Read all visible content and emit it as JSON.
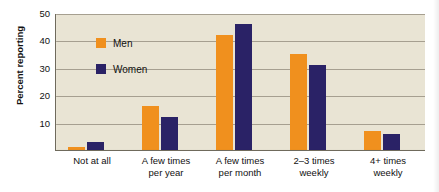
{
  "chart_data": {
    "type": "bar",
    "title": "",
    "xlabel": "",
    "ylabel": "Percent reporting",
    "ylim": [
      0,
      50
    ],
    "yticks": [
      10,
      20,
      30,
      40,
      50
    ],
    "grid": true,
    "legend_position": "top-left",
    "categories": [
      "Not at all",
      "A few times\nper year",
      "A few times\nper month",
      "2–3 times\nweekly",
      "4+ times\nweekly"
    ],
    "series": [
      {
        "name": "Men",
        "color": "#f0901e",
        "values": [
          1,
          16,
          42,
          35,
          7
        ]
      },
      {
        "name": "Women",
        "color": "#2a2266",
        "values": [
          3,
          12,
          46,
          31,
          6
        ]
      }
    ]
  },
  "legend": {
    "items": [
      {
        "label": "Men",
        "color": "#f0901e"
      },
      {
        "label": "Women",
        "color": "#2a2266"
      }
    ]
  },
  "axis": {
    "y_title": "Percent reporting",
    "y_tick_labels": [
      "50",
      "40",
      "30",
      "20",
      "10"
    ],
    "x_tick_labels": [
      "Not at all",
      "A few times\nper year",
      "A few times\nper month",
      "2–3 times\nweekly",
      "4+ times\nweekly"
    ]
  },
  "colors": {
    "men": "#f0901e",
    "women": "#2a2266",
    "plot_background": "#e9e4d4",
    "gridline": "#9a9384",
    "axis": "#6f6a5c",
    "page_background": "#ffffff"
  }
}
